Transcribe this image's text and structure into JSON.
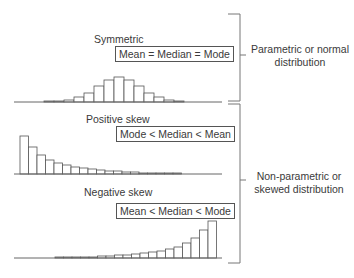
{
  "panels": [
    {
      "id": "symmetric",
      "title": "Symmetric",
      "relation": "Mean = Median = Mode"
    },
    {
      "id": "positive",
      "title": "Positive skew",
      "relation": "Mode < Median < Mean"
    },
    {
      "id": "negative",
      "title": "Negative skew",
      "relation": "Mean < Median < Mode"
    }
  ],
  "groups": [
    {
      "label_line1": "Parametric or normal",
      "label_line2": "distribution"
    },
    {
      "label_line1": "Non-parametric or",
      "label_line2": "skewed distribution"
    }
  ],
  "chart_data": [
    {
      "type": "bar",
      "title": "Symmetric",
      "values": [
        1,
        1,
        2,
        5,
        9,
        16,
        22,
        25,
        22,
        16,
        9,
        5,
        2,
        1
      ]
    },
    {
      "type": "bar",
      "title": "Positive skew",
      "values": [
        38,
        27,
        19,
        14,
        11,
        9,
        7,
        6,
        5,
        4,
        3,
        3,
        2,
        2,
        1,
        1,
        1,
        1,
        1
      ]
    },
    {
      "type": "bar",
      "title": "Negative skew",
      "values": [
        1,
        1,
        1,
        1,
        1,
        2,
        2,
        3,
        3,
        4,
        5,
        6,
        7,
        9,
        11,
        15,
        20,
        28,
        37
      ]
    }
  ],
  "colors": {
    "stroke": "#555555",
    "text": "#3a3a3a",
    "bar_fill": "#ffffff"
  }
}
